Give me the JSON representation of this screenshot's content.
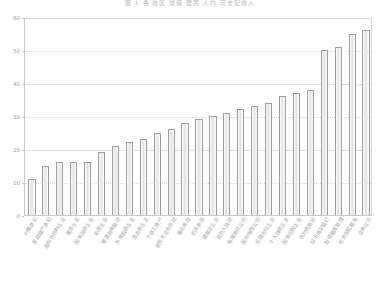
{
  "chart_data": {
    "type": "bar",
    "title": "图 1 各 地区 城镇 居民 人均 可支配收入",
    "xlabel": "",
    "ylabel": "",
    "ylim": [
      0,
      60
    ],
    "yticks": [
      0,
      10,
      20,
      30,
      40,
      50,
      60
    ],
    "grid": true,
    "legend": "none",
    "bar_color": "#e6e6e6",
    "bar_edge_color": "#9e9e9e",
    "categories": [
      "村集体化",
      "家庭联产承包",
      "股份合作制企业",
      "集体企业",
      "国有独资企业",
      "私营企业",
      "港澳台商投资",
      "外商投资企业",
      "民办非企业",
      "个体工商户",
      "农民专业合作社",
      "事业单位",
      "机关单位",
      "建筑业企业",
      "自然人独资",
      "有限责任公司",
      "股份有限公司",
      "无限合伙企业",
      "个人独资企业",
      "国有控股企业",
      "农村信用社",
      "城市商业银行",
      "投资基金管理",
      "社会保险基金",
      "证券公司"
    ],
    "values": [
      11,
      15,
      16,
      16,
      16,
      19,
      21,
      22,
      23,
      25,
      26,
      28,
      29,
      30,
      31,
      32,
      33,
      34,
      36,
      37,
      38,
      50,
      51,
      55,
      56
    ]
  }
}
